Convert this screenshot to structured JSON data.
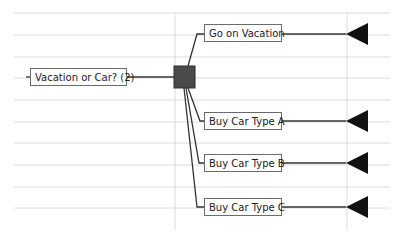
{
  "diagram": {
    "type": "decision-tree",
    "root": {
      "label": "Vacation or Car? (2)"
    },
    "decision_node": {
      "shape": "square",
      "color": "#4a4a4a"
    },
    "branches": [
      {
        "label": "Go on Vacation",
        "terminal": "triangle"
      },
      {
        "label": "Buy Car Type A",
        "terminal": "triangle"
      },
      {
        "label": "Buy Car Type B",
        "terminal": "triangle"
      },
      {
        "label": "Buy Car Type C",
        "terminal": "triangle"
      }
    ],
    "colors": {
      "line": "#333333",
      "grid": "#d9d9d9",
      "terminal": "#111111"
    }
  }
}
